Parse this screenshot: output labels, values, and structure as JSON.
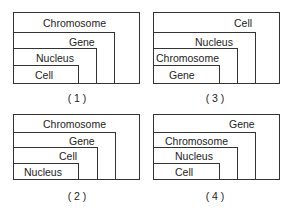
{
  "panels": [
    {
      "caption": "( 1 )",
      "levels": [
        "Chromosome",
        "Gene",
        "Nucleus",
        "Cell"
      ]
    },
    {
      "caption": "( 2 )",
      "levels": [
        "Chromosome",
        "Gene",
        "Cell",
        "Nucleus"
      ]
    },
    {
      "caption": "( 3 )",
      "levels": [
        "Cell",
        "Nucleus",
        "Chromosome",
        "Gene"
      ]
    },
    {
      "caption": "( 4 )",
      "levels": [
        "Gene",
        "Chromosome",
        "Nucleus",
        "Cell"
      ]
    }
  ]
}
